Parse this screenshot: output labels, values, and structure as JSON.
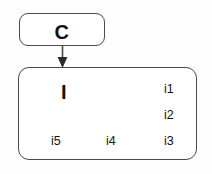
{
  "diagram": {
    "type": "component-instance-diagram",
    "background_color": "#fdfdfd",
    "stroke_color": "#4a4a4a",
    "text_color": "#111111",
    "component": {
      "label": "C",
      "shape": "rounded-rectangle"
    },
    "instance": {
      "label": "I",
      "shape": "rounded-rectangle",
      "ports": [
        {
          "label": "i1",
          "position": "right-top"
        },
        {
          "label": "i2",
          "position": "right-middle"
        },
        {
          "label": "i3",
          "position": "right-bottom"
        },
        {
          "label": "i4",
          "position": "bottom-center"
        },
        {
          "label": "i5",
          "position": "bottom-left"
        }
      ]
    },
    "connector": {
      "from": "C",
      "to": "I",
      "style": "solid-line",
      "arrowhead": "filled-triangle",
      "direction": "down"
    }
  }
}
